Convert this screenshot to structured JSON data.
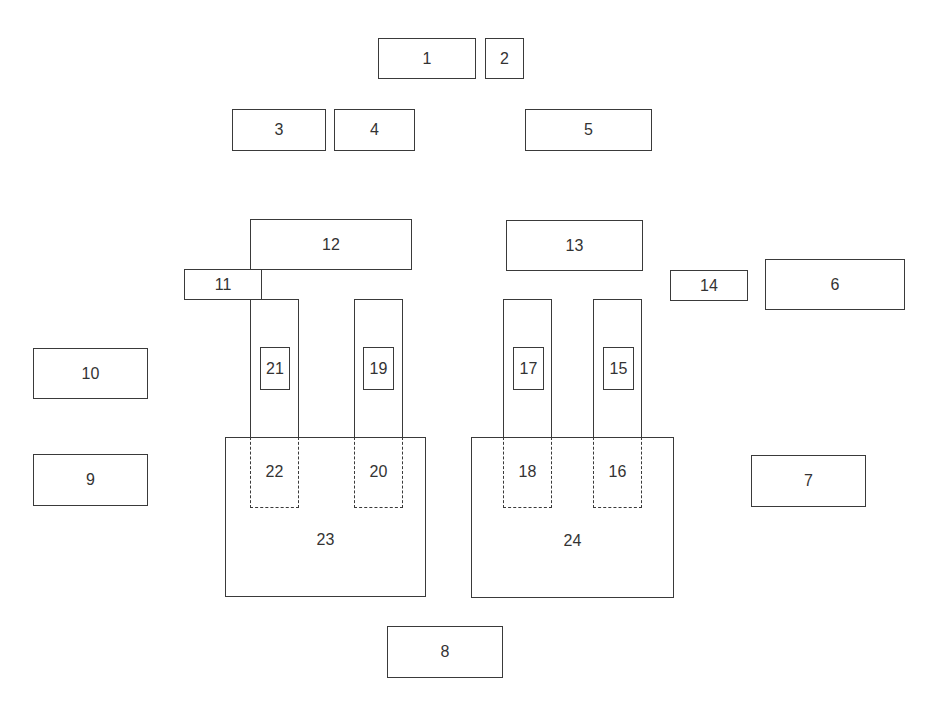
{
  "diagram": {
    "stroke_color": "#3a3a3a",
    "text_color": "#333333",
    "boxes": [
      {
        "id": "1",
        "label": "1",
        "x": 378,
        "y": 38,
        "w": 98,
        "h": 41,
        "style": "solid"
      },
      {
        "id": "2",
        "label": "2",
        "x": 485,
        "y": 38,
        "w": 39,
        "h": 41,
        "style": "solid"
      },
      {
        "id": "3",
        "label": "3",
        "x": 232,
        "y": 109,
        "w": 94,
        "h": 42,
        "style": "solid"
      },
      {
        "id": "4",
        "label": "4",
        "x": 334,
        "y": 109,
        "w": 81,
        "h": 42,
        "style": "solid"
      },
      {
        "id": "5",
        "label": "5",
        "x": 525,
        "y": 109,
        "w": 127,
        "h": 42,
        "style": "solid"
      },
      {
        "id": "6",
        "label": "6",
        "x": 765,
        "y": 259,
        "w": 140,
        "h": 51,
        "style": "solid"
      },
      {
        "id": "7",
        "label": "7",
        "x": 751,
        "y": 455,
        "w": 115,
        "h": 52,
        "style": "solid"
      },
      {
        "id": "8",
        "label": "8",
        "x": 387,
        "y": 626,
        "w": 116,
        "h": 52,
        "style": "solid"
      },
      {
        "id": "9",
        "label": "9",
        "x": 33,
        "y": 454,
        "w": 115,
        "h": 52,
        "style": "solid"
      },
      {
        "id": "10",
        "label": "10",
        "x": 33,
        "y": 348,
        "w": 115,
        "h": 51,
        "style": "solid"
      },
      {
        "id": "11",
        "label": "11",
        "x": 184,
        "y": 269,
        "w": 78,
        "h": 31,
        "style": "solid"
      },
      {
        "id": "12",
        "label": "12",
        "x": 250,
        "y": 219,
        "w": 162,
        "h": 51,
        "style": "solid"
      },
      {
        "id": "13",
        "label": "13",
        "x": 506,
        "y": 220,
        "w": 137,
        "h": 51,
        "style": "solid"
      },
      {
        "id": "14",
        "label": "14",
        "x": 670,
        "y": 270,
        "w": 78,
        "h": 31,
        "style": "solid"
      },
      {
        "id": "15",
        "label": "15",
        "x": 603,
        "y": 347,
        "w": 31,
        "h": 43,
        "style": "solid",
        "parent": "column-15"
      },
      {
        "id": "16",
        "label": "16",
        "x": 593,
        "y": 437,
        "w": 49,
        "h": 71,
        "style": "dashed"
      },
      {
        "id": "17",
        "label": "17",
        "x": 513,
        "y": 347,
        "w": 31,
        "h": 43,
        "style": "solid",
        "parent": "column-17"
      },
      {
        "id": "18",
        "label": "18",
        "x": 503,
        "y": 437,
        "w": 49,
        "h": 71,
        "style": "dashed"
      },
      {
        "id": "19",
        "label": "19",
        "x": 363,
        "y": 347,
        "w": 31,
        "h": 43,
        "style": "solid",
        "parent": "column-19"
      },
      {
        "id": "20",
        "label": "20",
        "x": 354,
        "y": 437,
        "w": 49,
        "h": 71,
        "style": "dashed"
      },
      {
        "id": "21",
        "label": "21",
        "x": 260,
        "y": 347,
        "w": 30,
        "h": 43,
        "style": "solid",
        "parent": "column-21"
      },
      {
        "id": "22",
        "label": "22",
        "x": 250,
        "y": 437,
        "w": 49,
        "h": 71,
        "style": "dashed"
      },
      {
        "id": "23",
        "label": "23",
        "x": 225,
        "y": 437,
        "w": 201,
        "h": 160,
        "style": "solid"
      },
      {
        "id": "24",
        "label": "24",
        "x": 471,
        "y": 437,
        "w": 203,
        "h": 161,
        "style": "solid"
      }
    ],
    "columns": [
      {
        "id": "column-21",
        "x": 250,
        "y": 299,
        "w": 49,
        "h": 139
      },
      {
        "id": "column-19",
        "x": 354,
        "y": 299,
        "w": 49,
        "h": 139
      },
      {
        "id": "column-17",
        "x": 503,
        "y": 299,
        "w": 49,
        "h": 139
      },
      {
        "id": "column-15",
        "x": 593,
        "y": 299,
        "w": 49,
        "h": 139
      }
    ]
  }
}
